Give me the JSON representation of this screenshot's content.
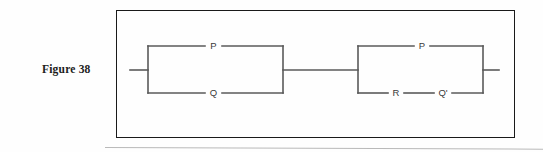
{
  "figure": {
    "label": "Figure 38",
    "type": "switching-circuit-diagram"
  },
  "circuit": {
    "description": "Two parallel switching blocks connected in series",
    "blocks": [
      {
        "name": "left-block",
        "arrangement": "parallel",
        "branches": [
          {
            "position": "top",
            "elements": [
              "P"
            ]
          },
          {
            "position": "bottom",
            "elements": [
              "Q"
            ]
          }
        ]
      },
      {
        "name": "right-block",
        "arrangement": "parallel",
        "branches": [
          {
            "position": "top",
            "elements": [
              "P"
            ]
          },
          {
            "position": "bottom",
            "elements": [
              "R",
              "Q'"
            ]
          }
        ]
      }
    ],
    "labels": {
      "left_top": "P",
      "left_bottom": "Q",
      "right_top": "P",
      "right_bottom_first": "R",
      "right_bottom_second": "Q'"
    },
    "terminals": {
      "input": "left-lead",
      "output": "right-lead"
    }
  },
  "colors": {
    "frame": "#1a1a1a",
    "wire": "#5a5a5a",
    "label_text": "#3a3a3a",
    "caption": "#1c1c1c",
    "page_rule": "#b9b9b9",
    "background": "#fefefe"
  }
}
